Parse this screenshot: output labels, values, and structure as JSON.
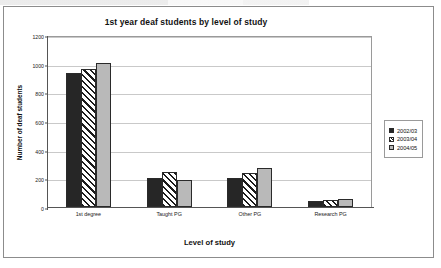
{
  "chart_data": {
    "type": "bar",
    "title": "1st year deaf students by level of study",
    "xlabel": "Level of study",
    "ylabel": "Number of deaf students",
    "categories": [
      "1st degree",
      "Taught PG",
      "Other PG",
      "Research PG"
    ],
    "series": [
      {
        "name": "2002/03",
        "values": [
          935,
          205,
          205,
          45
        ],
        "color": "#262626",
        "fill": "solid-black"
      },
      {
        "name": "2003/04",
        "values": [
          965,
          245,
          240,
          50
        ],
        "color": "#1c1c1c",
        "fill": "diagonal-hatch"
      },
      {
        "name": "2004/05",
        "values": [
          1005,
          190,
          275,
          55
        ],
        "color": "#b9b9b9",
        "fill": "solid-grey"
      }
    ],
    "ylim": [
      0,
      1200
    ],
    "yticks": [
      0,
      200,
      400,
      600,
      800,
      1000,
      1200
    ],
    "ytick_labels": [
      "0",
      "200",
      "400",
      "600",
      "800",
      "1000",
      "1200"
    ],
    "grid": "horizontal",
    "legend_position": "right-outside"
  },
  "legend": {
    "entries": [
      {
        "label": "2002/03"
      },
      {
        "label": "2003/04"
      },
      {
        "label": "2004/05"
      }
    ]
  }
}
